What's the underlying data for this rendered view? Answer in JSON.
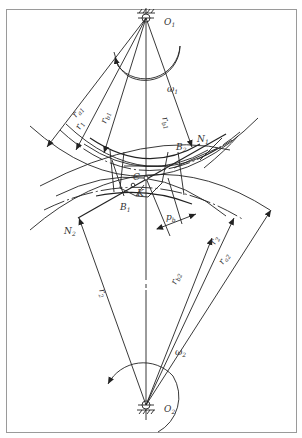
{
  "figure": {
    "type": "gear-meshing-diagram",
    "points": {
      "O1": "O1",
      "O2": "O2",
      "C": "C",
      "K": "K",
      "N1": "N1",
      "N2": "N2",
      "B1": "B1",
      "B2": "B2"
    },
    "labels": {
      "O1": {
        "base": "O",
        "sub": "1"
      },
      "O2": {
        "base": "O",
        "sub": "2"
      },
      "omega1": {
        "base": "ω",
        "sub": "1"
      },
      "omega2": {
        "base": "ω",
        "sub": "2"
      },
      "C": {
        "base": "C",
        "sub": ""
      },
      "K": {
        "base": "K",
        "sub": ""
      },
      "N1": {
        "base": "N",
        "sub": "1"
      },
      "N2": {
        "base": "N",
        "sub": "2"
      },
      "B1": {
        "base": "B",
        "sub": "1"
      },
      "B2": {
        "base": "B",
        "sub": "2"
      },
      "pb": {
        "base": "p",
        "sub": "b"
      },
      "ra1": {
        "base": "r",
        "sub": "a1"
      },
      "r1": {
        "base": "r",
        "sub": "1"
      },
      "rb1_left": {
        "base": "r",
        "sub": "b1"
      },
      "rb1_right": {
        "base": "r",
        "sub": "b1"
      },
      "r2_left": {
        "base": "r",
        "sub": "2"
      },
      "rb2": {
        "base": "r",
        "sub": "b2"
      },
      "r2_right": {
        "base": "r",
        "sub": "2"
      },
      "ra2": {
        "base": "r",
        "sub": "a2"
      }
    },
    "colors": {
      "line": "#222222",
      "frame": "#9a9a9a",
      "text": "#333333"
    }
  }
}
